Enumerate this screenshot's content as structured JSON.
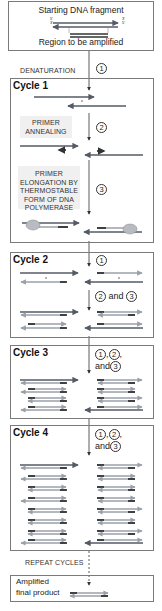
{
  "start": {
    "title": "Starting DNA fragment",
    "subtitle": "Region to be amplified",
    "top_left": "5'",
    "bot_left": "3'",
    "top_right": "3'",
    "bot_right": "5'"
  },
  "denaturation": {
    "label": "DENATURATION",
    "step": "1"
  },
  "cycle1": {
    "title": "Cycle 1",
    "annealing_label": "PRIMER ANNEALING",
    "annealing_step": "2",
    "elongation_label": "PRIMER ELONGATION BY THERMOSTABLE FORM OF DNA POLYMERASE",
    "elongation_step": "3"
  },
  "cycle2": {
    "title": "Cycle 2",
    "step1": "1",
    "step2": "2",
    "and": "and",
    "step3": "3"
  },
  "cycle3": {
    "title": "Cycle 3",
    "step1": "1",
    "step2": "2",
    "and": "and",
    "step3": "3"
  },
  "cycle4": {
    "title": "Cycle 4",
    "step1": "1",
    "step2": "2",
    "and": "and",
    "step3": "3"
  },
  "repeat": {
    "label": "REPEAT CYCLES"
  },
  "final": {
    "line1": "Amplified",
    "line2": "final product"
  },
  "colors": {
    "original_strand": "#555a66",
    "new_strand": "#9aa0a8",
    "primer": "#222222",
    "polymerase": "#b8bcc2",
    "label_bg": "#f0f0f0",
    "border": "#7a7a7a"
  }
}
